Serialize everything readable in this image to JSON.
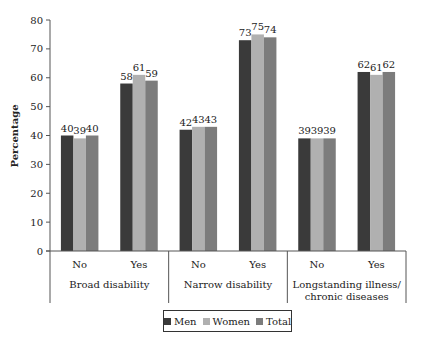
{
  "chart_data": {
    "type": "bar",
    "title": "",
    "xlabel": "",
    "ylabel": "Percentage",
    "ylim": [
      0,
      80
    ],
    "yticks": [
      0,
      10,
      20,
      30,
      40,
      50,
      60,
      70,
      80
    ],
    "grid": false,
    "legend_position": "bottom",
    "groups": [
      {
        "label": "Broad disability",
        "categories": [
          "No",
          "Yes"
        ]
      },
      {
        "label": "Narrow disability",
        "categories": [
          "No",
          "Yes"
        ]
      },
      {
        "label": "Longstanding illness/ chronic diseases",
        "label_lines": [
          "Longstanding illness/",
          "chronic diseases"
        ],
        "categories": [
          "No",
          "Yes"
        ]
      }
    ],
    "categories": [
      "Broad disability - No",
      "Broad disability - Yes",
      "Narrow disability - No",
      "Narrow disability - Yes",
      "Longstanding illness/chronic diseases - No",
      "Longstanding illness/chronic diseases - Yes"
    ],
    "series": [
      {
        "name": "Men",
        "color": "#3a3a3a",
        "values": [
          40,
          58,
          42,
          73,
          39,
          62
        ]
      },
      {
        "name": "Women",
        "color": "#b0b0b0",
        "values": [
          39,
          61,
          43,
          75,
          39,
          61
        ]
      },
      {
        "name": "Total",
        "color": "#7c7c7c",
        "values": [
          40,
          59,
          43,
          74,
          39,
          62
        ]
      }
    ]
  }
}
